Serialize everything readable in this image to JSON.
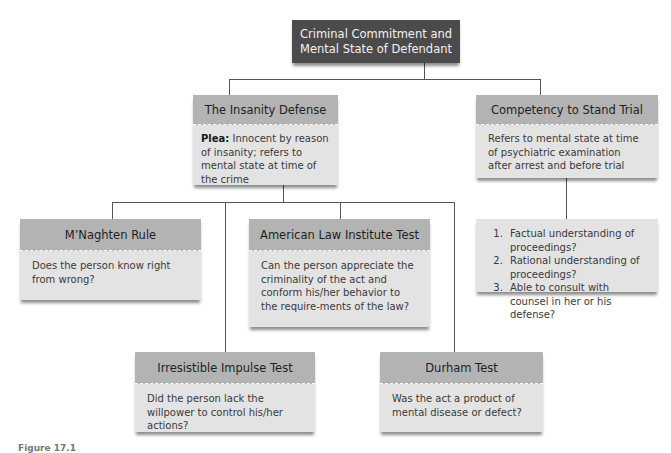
{
  "root": {
    "title_line1": "Criminal Commitment and",
    "title_line2": "Mental State of Defendant"
  },
  "insanity_defense": {
    "title": "The Insanity Defense",
    "plea_label": "Plea:",
    "plea_text": " Innocent by reason of insanity; refers to mental state at time of the crime"
  },
  "competency": {
    "title": "Competency to Stand Trial",
    "description": "Refers to mental state at time of psychiatric examination after arrest and before trial",
    "criteria": [
      "Factual understanding of proceedings?",
      "Rational understanding of proceedings?",
      "Able to consult with counsel in her or his defense?"
    ]
  },
  "tests": {
    "mnaghten": {
      "title": "M’Naghten Rule",
      "question": "Does the person know right from wrong?"
    },
    "ali": {
      "title": "American Law Institute Test",
      "question": "Can the person appreciate the criminality of the act and conform his/her behavior to the require-ments of the law?"
    },
    "irresistible": {
      "title": "Irresistible Impulse Test",
      "question": "Did the person lack the willpower to control his/her actions?"
    },
    "durham": {
      "title": "Durham Test",
      "question": "Was the act a product of mental disease or defect?"
    }
  },
  "caption": "Figure 17.1"
}
